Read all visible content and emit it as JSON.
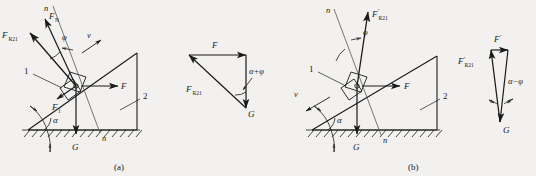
{
  "figure": {
    "title_a": "(a)",
    "title_b": "(b)",
    "background_color": "#f2f1ef",
    "line_color": "#1a1a1a"
  },
  "diagram_a": {
    "caption": "(a)",
    "labels": {
      "normal_line_top": "n",
      "normal_line_bottom": "n",
      "normal_force": "F",
      "normal_force_sub": "N",
      "resultant_reaction": "F",
      "resultant_reaction_sub": "R21",
      "friction_force": "F",
      "friction_force_sub": "f",
      "friction_angle": "φ",
      "velocity": "v",
      "applied_force": "F",
      "weight": "G",
      "incline_angle": "α",
      "body_one": "1",
      "body_two": "2"
    }
  },
  "triangle_a": {
    "labels": {
      "applied_force": "F",
      "resultant_reaction": "F",
      "resultant_reaction_sub": "R21",
      "weight": "G",
      "angle": "α+φ"
    }
  },
  "diagram_b": {
    "caption": "(b)",
    "labels": {
      "normal_line_top": "n",
      "normal_line_bottom": "n",
      "resultant_reaction": "F",
      "resultant_reaction_prime": "′",
      "resultant_reaction_sub": "R21",
      "friction_angle": "φ",
      "velocity": "v",
      "applied_force": "F",
      "weight": "G",
      "incline_angle": "α",
      "body_one": "1",
      "body_two": "2"
    }
  },
  "triangle_b": {
    "labels": {
      "applied_force": "F",
      "applied_force_prime": "′",
      "resultant_reaction": "F",
      "resultant_reaction_prime": "′",
      "resultant_reaction_sub": "R21",
      "weight": "G",
      "angle": "α−φ"
    }
  }
}
